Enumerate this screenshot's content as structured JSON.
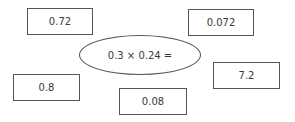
{
  "question": {
    "expression": "0.3 × 0.24 ="
  },
  "options": [
    {
      "label": "0.72"
    },
    {
      "label": "0.072"
    },
    {
      "label": "0.8"
    },
    {
      "label": "0.08"
    },
    {
      "label": "7.2"
    }
  ]
}
